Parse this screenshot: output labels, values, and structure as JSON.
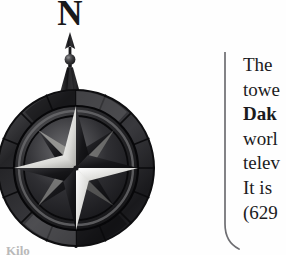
{
  "page": {
    "background_color": "#fefefe",
    "ink_color": "#1b1b1d"
  },
  "compass": {
    "north_label": "N",
    "icon_name": "compass-rose-north-arrow",
    "description": "Ornate engraved compass rose with eight-pointed star, outer spoked ring and finial spire",
    "colors": {
      "dark": "#1e1e20",
      "mid": "#575759",
      "light": "#d8d8d6",
      "highlight": "#f2f2f0"
    }
  },
  "divider": {
    "icon_name": "bracket-divider",
    "color": "#6a6a6e"
  },
  "body_text": {
    "lines": [
      {
        "text": "The",
        "bold": false
      },
      {
        "text": "towe",
        "bold": false
      },
      {
        "text": "Dak",
        "bold": true
      },
      {
        "text": "worl",
        "bold": false
      },
      {
        "text": "telev",
        "bold": false
      },
      {
        "text": "It is",
        "bold": false
      },
      {
        "text": "(629",
        "bold": false
      }
    ]
  },
  "scale_caption": {
    "text": "Kilo"
  }
}
